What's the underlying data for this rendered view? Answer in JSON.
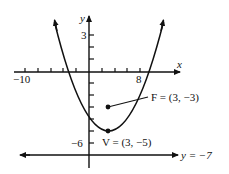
{
  "figure": {
    "type": "parabola-graph",
    "equation_implied": "(x-3)^2 = 8(y+5)",
    "axes": {
      "x_label": "x",
      "y_label": "y",
      "x_tick_labels": [
        {
          "value": -10,
          "text": "−10"
        },
        {
          "value": 8,
          "text": "8"
        }
      ],
      "y_tick_labels": [
        {
          "value": 3,
          "text": "3"
        },
        {
          "value": -6,
          "text": "−6"
        }
      ]
    },
    "points": {
      "focus": {
        "name": "F",
        "x": 3,
        "y": -3,
        "label": "F = (3, −3)"
      },
      "vertex": {
        "name": "V",
        "x": 3,
        "y": -5,
        "label": "V = (3, −5)"
      }
    },
    "directrix": {
      "y": -7,
      "label": "y = −7"
    },
    "colors": {
      "ink": "#111111",
      "background": "#ffffff"
    }
  }
}
